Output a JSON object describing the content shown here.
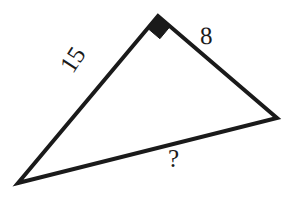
{
  "figure": {
    "background_color": "#ffffff",
    "stroke_color": "#1a1a1a",
    "stroke_width": 4,
    "labels": {
      "left_side": "15",
      "right_side": "8",
      "bottom_side": "?"
    },
    "right_angle_marker": {
      "name": "right-angle-marker",
      "shape": "filled-square",
      "color": "#1a1a1a",
      "at_vertex": "apex"
    },
    "vertices": {
      "apex": {
        "x": 158,
        "y": 16
      },
      "left": {
        "x": 18,
        "y": 183
      },
      "right": {
        "x": 277,
        "y": 118
      }
    },
    "geometry": {
      "type": "triangle",
      "sides": [
        {
          "name": "left-side",
          "from": "apex",
          "to": "left",
          "length_label": "15"
        },
        {
          "name": "right-side",
          "from": "apex",
          "to": "right",
          "length_label": "8"
        },
        {
          "name": "bottom-side",
          "from": "left",
          "to": "right",
          "length_label": "?"
        }
      ],
      "right_angle_at": "apex"
    }
  }
}
